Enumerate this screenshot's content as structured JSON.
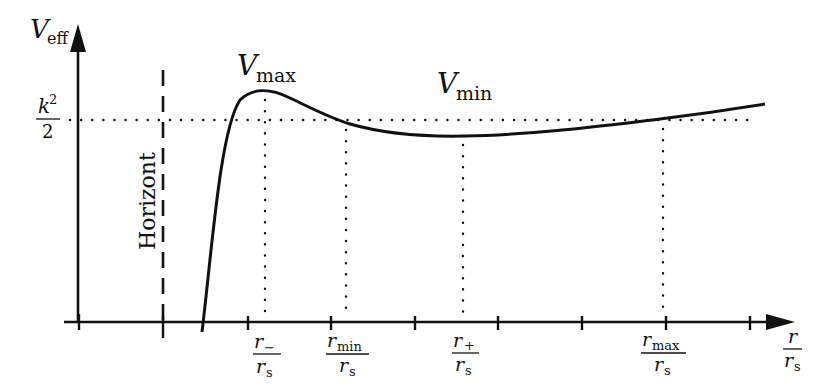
{
  "diagram": {
    "y_axis": {
      "symbol": "V",
      "subscript": "eff"
    },
    "x_axis": {
      "numerator": "r",
      "denominator": "r",
      "denominator_sub": "s"
    },
    "energy_level": {
      "numerator": "k",
      "superscript": "2",
      "denominator": "2"
    },
    "horizon_label": "Horizont",
    "vmax_label": {
      "symbol": "V",
      "subscript": "max"
    },
    "vmin_label": {
      "symbol": "V",
      "subscript": "min"
    },
    "x_labels": [
      {
        "num": "r",
        "num_sub": "−",
        "den": "r",
        "den_sub": "s"
      },
      {
        "num": "r",
        "num_sub": "min",
        "den": "r",
        "den_sub": "s"
      },
      {
        "num": "r",
        "num_sub": "+",
        "den": "r",
        "den_sub": "s"
      },
      {
        "num": "r",
        "num_sub": "max",
        "den": "r",
        "den_sub": "s"
      }
    ]
  }
}
